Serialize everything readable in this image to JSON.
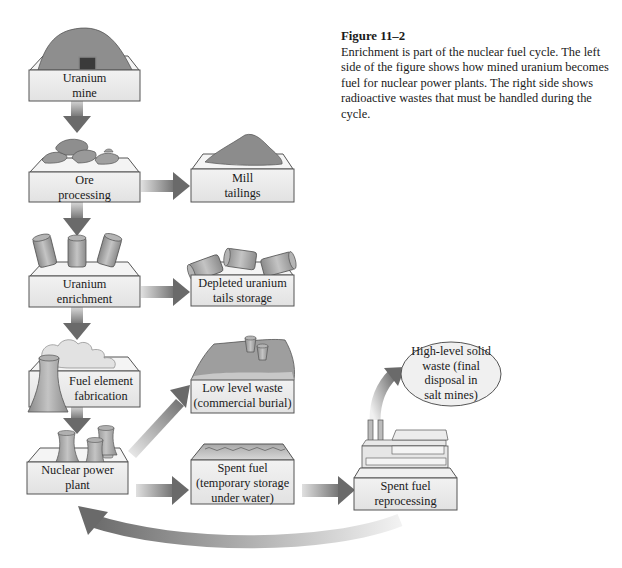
{
  "figure": {
    "title": "Figure 11–2",
    "caption": "Enrichment is part of the nuclear fuel cycle. The left side of the figure shows how mined uranium becomes fuel for nuclear power plants. The right side shows radioactive wastes that must be handled during the cycle."
  },
  "colors": {
    "box_face": "#ececec",
    "box_top": "#f4f4f4",
    "box_border": "#555555",
    "arrow": "#7a7a7a",
    "object": "#9a9a9a"
  },
  "nodes": {
    "uranium_mine": {
      "line1": "Uranium",
      "line2": "mine",
      "icon": "mine-hill"
    },
    "ore_processing": {
      "line1": "Ore",
      "line2": "processing",
      "icon": "ore-rocks"
    },
    "mill_tailings": {
      "line1": "Mill",
      "line2": "tailings",
      "icon": "tailings-pile"
    },
    "uranium_enrichment": {
      "line1": "Uranium",
      "line2": "enrichment",
      "icon": "barrels-upright"
    },
    "depleted_tails": {
      "line1": "Depleted uranium",
      "line2": "tails storage",
      "icon": "barrels-tipped"
    },
    "fuel_fabrication": {
      "line1": "Fuel element",
      "line2": "fabrication",
      "icon": "cooling-tower-steam"
    },
    "low_level_waste": {
      "line1": "Low level waste",
      "line2": "(commercial burial)",
      "icon": "buried-cans"
    },
    "nuclear_plant": {
      "line1": "Nuclear power",
      "line2": "plant",
      "icon": "cooling-towers"
    },
    "spent_fuel": {
      "line1": "Spent fuel",
      "line2": "(temporary storage",
      "line3": "under water)",
      "icon": "water-pool"
    },
    "reprocessing": {
      "line1": "Spent fuel",
      "line2": "reprocessing",
      "icon": "factory"
    },
    "high_level_waste": {
      "line1": "High-level solid",
      "line2": "waste (final",
      "line3": "disposal in",
      "line4": "salt mines)",
      "shape": "ellipse"
    }
  },
  "edges": [
    {
      "from": "uranium_mine",
      "to": "ore_processing"
    },
    {
      "from": "ore_processing",
      "to": "uranium_enrichment"
    },
    {
      "from": "ore_processing",
      "to": "mill_tailings"
    },
    {
      "from": "uranium_enrichment",
      "to": "fuel_fabrication"
    },
    {
      "from": "uranium_enrichment",
      "to": "depleted_tails"
    },
    {
      "from": "fuel_fabrication",
      "to": "nuclear_plant"
    },
    {
      "from": "nuclear_plant",
      "to": "low_level_waste"
    },
    {
      "from": "nuclear_plant",
      "to": "spent_fuel"
    },
    {
      "from": "spent_fuel",
      "to": "reprocessing"
    },
    {
      "from": "reprocessing",
      "to": "high_level_waste"
    },
    {
      "from": "reprocessing",
      "to": "nuclear_plant"
    }
  ]
}
